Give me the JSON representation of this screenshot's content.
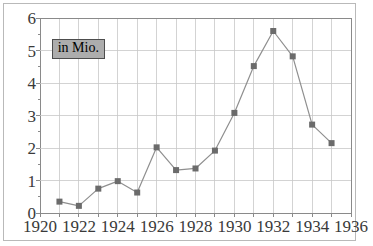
{
  "chart_data": {
    "type": "line",
    "title": "",
    "subtitle": "",
    "xlabel": "",
    "ylabel": "",
    "annotations": [
      {
        "text": "in Mio.",
        "x": 1920.6,
        "y": 5.05
      }
    ],
    "legend": [],
    "legend_position": "none",
    "grid": true,
    "xlim": [
      1920,
      1936
    ],
    "ylim": [
      0,
      6
    ],
    "xticks": [
      1920,
      1922,
      1924,
      1926,
      1928,
      1930,
      1932,
      1934,
      1936
    ],
    "xtick_labels": [
      "1920",
      "1922",
      "1924",
      "1926",
      "1928",
      "1930",
      "1932",
      "1934",
      "1936"
    ],
    "yticks": [
      0,
      1,
      2,
      3,
      4,
      5,
      6
    ],
    "ytick_labels": [
      "0",
      "1",
      "2",
      "3",
      "4",
      "5",
      "6"
    ],
    "x_gridlines": [
      1920,
      1921,
      1922,
      1923,
      1924,
      1925,
      1926,
      1927,
      1928,
      1929,
      1930,
      1931,
      1932,
      1933,
      1934,
      1935,
      1936
    ],
    "y_gridlines": [
      0,
      1,
      2,
      3,
      4,
      5,
      6
    ],
    "x": [
      1921,
      1922,
      1923,
      1924,
      1925,
      1926,
      1927,
      1928,
      1929,
      1930,
      1931,
      1932,
      1933,
      1934,
      1935
    ],
    "values": [
      0.35,
      0.22,
      0.75,
      0.98,
      0.63,
      2.02,
      1.32,
      1.37,
      1.92,
      3.08,
      4.52,
      5.6,
      4.82,
      2.72,
      2.15
    ],
    "series": [
      {
        "name": "",
        "x": [
          1921,
          1922,
          1923,
          1924,
          1925,
          1926,
          1927,
          1928,
          1929,
          1930,
          1931,
          1932,
          1933,
          1934,
          1935
        ],
        "values": [
          0.35,
          0.22,
          0.75,
          0.98,
          0.63,
          2.02,
          1.32,
          1.37,
          1.92,
          3.08,
          4.52,
          5.6,
          4.82,
          2.72,
          2.15
        ]
      }
    ]
  },
  "style": {
    "line_color": "#8f8f8f",
    "marker_color": "#6b6b6b",
    "grid_color": "#c8c8c8",
    "axis_color": "#8a8a8a",
    "tick_text_color": "#3a3a3a",
    "annotation_bg": "#adadad",
    "annotation_border": "#4d4d4d",
    "frame_border": "#b9b9b9",
    "background": "#ffffff"
  }
}
